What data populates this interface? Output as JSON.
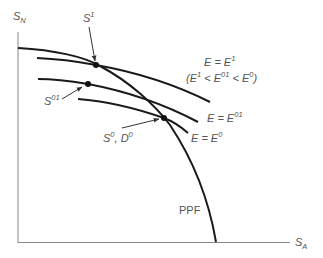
{
  "diagram": {
    "type": "economics-ppf",
    "axes": {
      "y_label_main": "S",
      "y_label_sub": "N",
      "x_label_main": "S",
      "x_label_sub": "A"
    },
    "curves": {
      "ppf_label": "PPF",
      "e1": {
        "label_main": "E = E",
        "label_sup": "1"
      },
      "e1_note": {
        "open": "(E",
        "s1": "1",
        "lt1": " < E",
        "s2": "01",
        "lt2": " < E",
        "s3": "0",
        "close": ")"
      },
      "e01": {
        "label_main": "E = E",
        "label_sup": "01"
      },
      "e0": {
        "label_main": "E = E",
        "label_sup": "0"
      }
    },
    "points": {
      "s1": {
        "main": "S",
        "sup": "1"
      },
      "s01": {
        "main": "S",
        "sup": "01"
      },
      "s0d0": {
        "main1": "S",
        "sup1": "0",
        "sep": ", ",
        "main2": "D",
        "sup2": "0"
      }
    },
    "colors": {
      "curve": "#1a1a1a",
      "axis": "#777777",
      "text": "#555555"
    }
  }
}
